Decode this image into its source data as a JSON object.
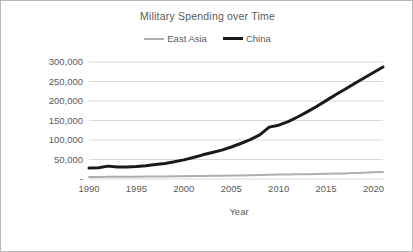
{
  "chart_data": {
    "type": "line",
    "title": "Military Spending over Time",
    "xlabel": "Year",
    "ylabel": "Military Spending in $1,000,000",
    "xlim": [
      1990,
      2021
    ],
    "ylim": [
      0,
      300000
    ],
    "grid": true,
    "legend_position": "top",
    "y_ticks": [
      "-",
      "50,000",
      "100,000",
      "150,000",
      "200,000",
      "250,000",
      "300,000"
    ],
    "y_tick_values": [
      0,
      50000,
      100000,
      150000,
      200000,
      250000,
      300000
    ],
    "x_ticks": [
      "1990",
      "1995",
      "2000",
      "2005",
      "2010",
      "2015",
      "2020"
    ],
    "x_tick_values": [
      1990,
      1995,
      2000,
      2005,
      2010,
      2015,
      2020
    ],
    "x": [
      1990,
      1991,
      1992,
      1993,
      1994,
      1995,
      1996,
      1997,
      1998,
      1999,
      2000,
      2001,
      2002,
      2003,
      2004,
      2005,
      2006,
      2007,
      2008,
      2009,
      2010,
      2011,
      2012,
      2013,
      2014,
      2015,
      2016,
      2017,
      2018,
      2019,
      2020,
      2021
    ],
    "series": [
      {
        "name": "East Asia",
        "color": "#aeaeae",
        "width": 2,
        "values": [
          5000,
          5200,
          5500,
          5600,
          5800,
          6000,
          6200,
          6400,
          6500,
          6800,
          7000,
          7400,
          7800,
          8100,
          8400,
          8800,
          9200,
          9600,
          10200,
          11000,
          11500,
          11800,
          12000,
          12300,
          12800,
          13200,
          13800,
          14400,
          15200,
          16000,
          17000,
          18000
        ]
      },
      {
        "name": "China",
        "color": "#1a1a1a",
        "width": 3,
        "values": [
          28000,
          29000,
          33000,
          31000,
          31000,
          32000,
          34000,
          37000,
          40000,
          44000,
          49000,
          55000,
          62000,
          68000,
          74000,
          82000,
          91000,
          101000,
          113000,
          133000,
          138000,
          147000,
          159000,
          172000,
          186000,
          201000,
          216000,
          230000,
          245000,
          259000,
          273000,
          287000
        ]
      }
    ]
  },
  "chart": {
    "title": "Military Spending over Time",
    "x_axis_title": "Year",
    "y_axis_title": "Military Spending in $1,000,000",
    "legend": [
      {
        "label": "East Asia",
        "color": "#aeaeae"
      },
      {
        "label": "China",
        "color": "#1a1a1a"
      }
    ]
  }
}
